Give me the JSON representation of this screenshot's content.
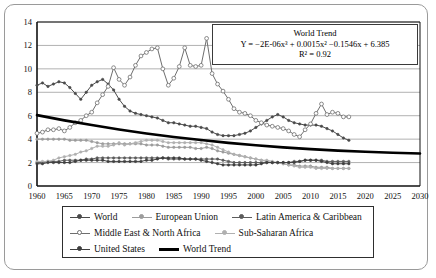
{
  "chart_data": {
    "type": "line",
    "title": "",
    "xlabel": "",
    "ylabel": "",
    "xlim": [
      1960,
      2030
    ],
    "ylim": [
      0,
      14
    ],
    "xticks": [
      1960,
      1965,
      1970,
      1975,
      1980,
      1985,
      1990,
      1995,
      2000,
      2005,
      2010,
      2015,
      2020,
      2025,
      2030
    ],
    "yticks": [
      0,
      2,
      4,
      6,
      8,
      10,
      12,
      14
    ],
    "grid": "horizontal",
    "legend_position": "bottom",
    "annotation": {
      "title": "World Trend",
      "equation": "Y = −2E-06x³ + 0.0015x² −0.1546x + 6.385",
      "r2": "R² = 0.92"
    },
    "series": [
      {
        "name": "World",
        "color": "#4a4a4a",
        "marker": "dot",
        "x": [
          1960,
          1961,
          1962,
          1963,
          1964,
          1965,
          1966,
          1967,
          1968,
          1969,
          1970,
          1971,
          1972,
          1973,
          1974,
          1975,
          1976,
          1977,
          1978,
          1979,
          1980,
          1981,
          1982,
          1983,
          1984,
          1985,
          1986,
          1987,
          1988,
          1989,
          1990,
          1991,
          1992,
          1993,
          1994,
          1995,
          1996,
          1997,
          1998,
          1999,
          2000,
          2001,
          2002,
          2003,
          2004,
          2005,
          2006,
          2007,
          2008,
          2009,
          2010,
          2011,
          2012,
          2013,
          2014,
          2015,
          2016,
          2017
        ],
        "y": [
          8.6,
          8.8,
          8.5,
          8.7,
          8.9,
          8.8,
          8.4,
          7.9,
          7.4,
          8.0,
          8.6,
          8.9,
          9.1,
          8.7,
          8.2,
          7.4,
          6.8,
          6.4,
          6.2,
          6.1,
          6.0,
          5.9,
          5.8,
          5.6,
          5.4,
          5.4,
          5.3,
          5.2,
          5.1,
          5.1,
          5.0,
          4.9,
          4.6,
          4.4,
          4.3,
          4.3,
          4.3,
          4.4,
          4.5,
          4.7,
          5.0,
          5.3,
          5.6,
          5.9,
          6.1,
          5.9,
          5.6,
          5.4,
          5.3,
          5.2,
          5.2,
          5.2,
          5.1,
          4.9,
          4.7,
          4.4,
          4.1,
          3.9
        ]
      },
      {
        "name": "European Union",
        "color": "#9c9c9c",
        "marker": "dot",
        "x": [
          1960,
          1961,
          1962,
          1963,
          1964,
          1965,
          1966,
          1967,
          1968,
          1969,
          1970,
          1971,
          1972,
          1973,
          1974,
          1975,
          1976,
          1977,
          1978,
          1979,
          1980,
          1981,
          1982,
          1983,
          1984,
          1985,
          1986,
          1987,
          1988,
          1989,
          1990,
          1991,
          1992,
          1993,
          1994,
          1995,
          1996,
          1997,
          1998,
          1999,
          2000,
          2001,
          2002,
          2003,
          2004,
          2005,
          2006,
          2007,
          2008,
          2009,
          2010,
          2011,
          2012,
          2013,
          2014,
          2015,
          2016,
          2017
        ],
        "y": [
          4.0,
          4.0,
          4.0,
          4.0,
          4.0,
          4.0,
          3.9,
          3.9,
          3.9,
          3.9,
          3.8,
          3.7,
          3.6,
          3.6,
          3.6,
          3.6,
          3.6,
          3.6,
          3.6,
          3.6,
          3.5,
          3.5,
          3.5,
          3.4,
          3.3,
          3.3,
          3.3,
          3.3,
          3.3,
          3.2,
          3.2,
          3.3,
          3.2,
          3.0,
          2.9,
          2.8,
          2.7,
          2.6,
          2.5,
          2.4,
          2.3,
          2.2,
          2.1,
          2.0,
          2.0,
          1.9,
          1.8,
          1.8,
          1.7,
          1.7,
          1.7,
          1.6,
          1.6,
          1.6,
          1.5,
          1.5,
          1.5,
          1.5
        ]
      },
      {
        "name": "Latin America & Caribbean",
        "color": "#5c5c5c",
        "marker": "dot",
        "x": [
          1960,
          1961,
          1962,
          1963,
          1964,
          1965,
          1966,
          1967,
          1968,
          1969,
          1970,
          1971,
          1972,
          1973,
          1974,
          1975,
          1976,
          1977,
          1978,
          1979,
          1980,
          1981,
          1982,
          1983,
          1984,
          1985,
          1986,
          1987,
          1988,
          1989,
          1990,
          1991,
          1992,
          1993,
          1994,
          1995,
          1996,
          1997,
          1998,
          1999,
          2000,
          2001,
          2002,
          2003,
          2004,
          2005,
          2006,
          2007,
          2008,
          2009,
          2010,
          2011,
          2012,
          2013,
          2014,
          2015,
          2016,
          2017
        ],
        "y": [
          2.0,
          2.0,
          2.1,
          2.1,
          2.1,
          2.2,
          2.2,
          2.2,
          2.2,
          2.3,
          2.3,
          2.4,
          2.4,
          2.4,
          2.4,
          2.4,
          2.4,
          2.4,
          2.4,
          2.4,
          2.4,
          2.4,
          2.4,
          2.4,
          2.3,
          2.3,
          2.3,
          2.3,
          2.3,
          2.3,
          2.3,
          2.3,
          2.3,
          2.3,
          2.2,
          2.1,
          2.0,
          2.0,
          2.0,
          2.0,
          2.0,
          2.0,
          2.0,
          2.0,
          2.0,
          2.0,
          2.0,
          2.1,
          2.1,
          2.2,
          2.2,
          2.2,
          2.2,
          2.1,
          2.1,
          2.1,
          2.1,
          2.1
        ]
      },
      {
        "name": "Middle East & North Africa",
        "color": "#6e6e6e",
        "marker": "circle",
        "x": [
          1960,
          1961,
          1962,
          1963,
          1964,
          1965,
          1966,
          1967,
          1968,
          1969,
          1970,
          1971,
          1972,
          1973,
          1974,
          1975,
          1976,
          1977,
          1978,
          1979,
          1980,
          1981,
          1982,
          1983,
          1984,
          1985,
          1986,
          1987,
          1988,
          1989,
          1990,
          1991,
          1992,
          1993,
          1994,
          1995,
          1996,
          1997,
          1998,
          1999,
          2000,
          2001,
          2002,
          2003,
          2004,
          2005,
          2006,
          2007,
          2008,
          2009,
          2010,
          2011,
          2012,
          2013,
          2014,
          2015,
          2016,
          2017
        ],
        "y": [
          4.5,
          4.6,
          4.8,
          4.8,
          4.9,
          4.7,
          5.0,
          5.4,
          5.6,
          6.0,
          6.3,
          7.1,
          7.8,
          8.5,
          10.1,
          9.1,
          8.6,
          9.3,
          10.3,
          11.1,
          11.4,
          11.7,
          11.8,
          10.0,
          8.6,
          9.2,
          10.2,
          11.8,
          10.3,
          10.2,
          10.3,
          12.6,
          9.6,
          8.7,
          8.1,
          7.4,
          6.6,
          6.3,
          6.2,
          6.0,
          5.6,
          5.4,
          5.2,
          5.1,
          5.0,
          4.9,
          4.7,
          4.4,
          4.2,
          4.8,
          5.3,
          6.2,
          7.0,
          6.1,
          6.3,
          6.2,
          5.9,
          5.9
        ]
      },
      {
        "name": "Sub-Saharan Africa",
        "color": "#b0b0b0",
        "marker": "dot",
        "x": [
          1960,
          1961,
          1962,
          1963,
          1964,
          1965,
          1966,
          1967,
          1968,
          1969,
          1970,
          1971,
          1972,
          1973,
          1974,
          1975,
          1976,
          1977,
          1978,
          1979,
          1980,
          1981,
          1982,
          1983,
          1984,
          1985,
          1986,
          1987,
          1988,
          1989,
          1990,
          1991,
          1992,
          1993,
          1994,
          1995,
          1996,
          1997,
          1998,
          1999,
          2000,
          2001,
          2002,
          2003,
          2004,
          2005,
          2006,
          2007,
          2008,
          2009,
          2010,
          2011,
          2012,
          2013,
          2014,
          2015,
          2016,
          2017
        ],
        "y": [
          2.1,
          2.1,
          2.1,
          2.2,
          2.4,
          2.5,
          2.6,
          2.7,
          2.9,
          3.0,
          3.2,
          3.4,
          3.4,
          3.4,
          3.5,
          3.7,
          3.5,
          3.6,
          3.7,
          3.8,
          3.9,
          3.9,
          3.9,
          3.8,
          3.7,
          3.7,
          3.7,
          3.7,
          3.7,
          3.7,
          3.7,
          3.6,
          3.5,
          3.3,
          3.1,
          2.9,
          2.7,
          2.6,
          2.5,
          2.4,
          2.3,
          2.2,
          2.2,
          2.1,
          2.0,
          1.9,
          1.8,
          1.7,
          1.6,
          1.6,
          1.6,
          1.5,
          1.5,
          1.5,
          1.5,
          1.5,
          1.5,
          1.5
        ]
      },
      {
        "name": "United States",
        "color": "#3f3f3f",
        "marker": "dot",
        "x": [
          1960,
          1961,
          1962,
          1963,
          1964,
          1965,
          1966,
          1967,
          1968,
          1969,
          1970,
          1971,
          1972,
          1973,
          1974,
          1975,
          1976,
          1977,
          1978,
          1979,
          1980,
          1981,
          1982,
          1983,
          1984,
          1985,
          1986,
          1987,
          1988,
          1989,
          1990,
          1991,
          1992,
          1993,
          1994,
          1995,
          1996,
          1997,
          1998,
          1999,
          2000,
          2001,
          2002,
          2003,
          2004,
          2005,
          2006,
          2007,
          2008,
          2009,
          2010,
          2011,
          2012,
          2013,
          2014,
          2015,
          2016,
          2017
        ],
        "y": [
          1.9,
          1.9,
          2.0,
          2.0,
          2.0,
          2.0,
          2.0,
          2.1,
          2.2,
          2.2,
          2.2,
          2.2,
          2.2,
          2.1,
          2.1,
          2.1,
          2.1,
          2.1,
          2.1,
          2.1,
          2.2,
          2.2,
          2.3,
          2.4,
          2.4,
          2.4,
          2.4,
          2.3,
          2.3,
          2.3,
          2.2,
          2.1,
          2.0,
          1.9,
          1.8,
          1.8,
          1.8,
          1.8,
          1.8,
          1.8,
          1.8,
          1.9,
          2.0,
          2.0,
          2.0,
          2.0,
          2.0,
          2.0,
          2.1,
          2.2,
          2.2,
          2.2,
          2.1,
          2.0,
          1.9,
          1.9,
          1.9,
          1.9
        ]
      },
      {
        "name": "World Trend",
        "color": "#000000",
        "marker": "none",
        "thick": true,
        "x": [
          1960,
          1965,
          1970,
          1975,
          1980,
          1985,
          1990,
          1995,
          2000,
          2005,
          2010,
          2015,
          2020,
          2025,
          2030
        ],
        "y": [
          6.05,
          5.6,
          5.2,
          4.82,
          4.48,
          4.18,
          3.92,
          3.68,
          3.48,
          3.3,
          3.15,
          3.02,
          2.92,
          2.84,
          2.78
        ]
      }
    ]
  },
  "legend": {
    "rows": [
      [
        {
          "label": "World",
          "marker": "dot",
          "color": "#4a4a4a"
        },
        {
          "label": "European Union",
          "marker": "dot",
          "color": "#9c9c9c"
        },
        {
          "label": "Latin America & Caribbean",
          "marker": "dot",
          "color": "#5c5c5c"
        }
      ],
      [
        {
          "label": "Middle East & North Africa",
          "marker": "circle",
          "color": "#6e6e6e"
        },
        {
          "label": "Sub-Saharan Africa",
          "marker": "dot",
          "color": "#b0b0b0"
        }
      ],
      [
        {
          "label": "United States",
          "marker": "dot",
          "color": "#3f3f3f"
        },
        {
          "label": "World Trend",
          "marker": "thick",
          "color": "#000000"
        }
      ]
    ]
  }
}
